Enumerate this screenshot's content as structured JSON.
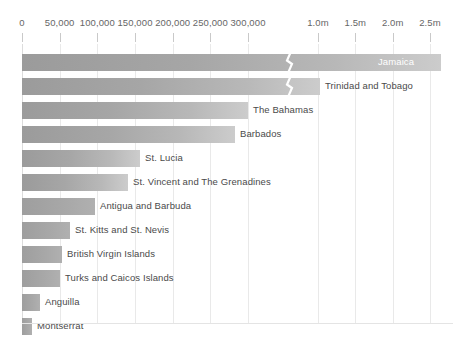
{
  "chart_data": {
    "type": "bar",
    "orientation": "horizontal",
    "title": "",
    "subtitle": "",
    "xlabel": "",
    "ylabel": "",
    "grid": true,
    "legend": "none",
    "broken_axis": true,
    "axis_note": "X axis is broken between 300,000 and 1.0m",
    "axis_segments": [
      {
        "min": 0,
        "max": 300000,
        "ticks": [
          0,
          50000,
          100000,
          150000,
          200000,
          250000,
          300000
        ]
      },
      {
        "min": 1000000,
        "max": 2500000,
        "ticks": [
          1000000,
          1500000,
          2000000,
          2500000
        ]
      }
    ],
    "tick_labels": [
      "0",
      "50,000",
      "100,000",
      "150,000",
      "200,000",
      "250,000",
      "300,000",
      "1.0m",
      "1.5m",
      "2.0m",
      "2.5m"
    ],
    "categories": [
      "Jamaica",
      "Trinidad and Tobago",
      "The Bahamas",
      "Barbados",
      "St. Lucia",
      "St. Vincent and The Grenadines",
      "Antigua and Barbuda",
      "St. Kitts and St. Nevis",
      "British Virgin Islands",
      "Turks and Caicos Islands",
      "Anguilla",
      "Montserrat"
    ],
    "values": [
      2800000,
      1390000,
      298000,
      282000,
      156000,
      140000,
      96000,
      63000,
      53000,
      50000,
      24000,
      13000
    ]
  },
  "axis": {
    "ticks": [
      {
        "label": "0",
        "x": 22,
        "gridline": true
      },
      {
        "label": "50,000",
        "x": 59.7,
        "gridline": true
      },
      {
        "label": "100,000",
        "x": 97.3,
        "gridline": true
      },
      {
        "label": "150,000",
        "x": 135,
        "gridline": true
      },
      {
        "label": "200,000",
        "x": 172.7,
        "gridline": true
      },
      {
        "label": "250,000",
        "x": 210.3,
        "gridline": true
      },
      {
        "label": "300,000",
        "x": 248,
        "gridline": true
      },
      {
        "label": "1.0m",
        "x": 318,
        "gridline": true
      },
      {
        "label": "1.5m",
        "x": 355.3,
        "gridline": true
      },
      {
        "label": "2.0m",
        "x": 392.7,
        "gridline": true
      },
      {
        "label": "2.5m",
        "x": 430,
        "gridline": true
      }
    ]
  },
  "bars": [
    {
      "label": "Jamaica",
      "value": 2800000,
      "end_x": 441,
      "label_inside": true,
      "label_x": 378,
      "break_x": 284,
      "top": 51
    },
    {
      "label": "Trinidad and Tobago",
      "value": 1390000,
      "end_x": 320,
      "label_inside": false,
      "label_x": 325,
      "break_x": 284,
      "top": 75
    },
    {
      "label": "The Bahamas",
      "value": 298000,
      "end_x": 248,
      "label_inside": false,
      "label_x": 253,
      "break_x": null,
      "top": 99
    },
    {
      "label": "Barbados",
      "value": 282000,
      "end_x": 235,
      "label_inside": false,
      "label_x": 240,
      "break_x": null,
      "top": 123
    },
    {
      "label": "St. Lucia",
      "value": 156000,
      "end_x": 140,
      "label_inside": false,
      "label_x": 145,
      "break_x": null,
      "top": 147
    },
    {
      "label": "St. Vincent and The Grenadines",
      "value": 140000,
      "end_x": 128,
      "label_inside": false,
      "label_x": 133,
      "break_x": null,
      "top": 171
    },
    {
      "label": "Antigua and Barbuda",
      "value": 96000,
      "end_x": 95,
      "label_inside": false,
      "label_x": 100,
      "break_x": null,
      "top": 195
    },
    {
      "label": "St. Kitts and St. Nevis",
      "value": 63000,
      "end_x": 70,
      "label_inside": false,
      "label_x": 75,
      "break_x": null,
      "top": 219
    },
    {
      "label": "British Virgin Islands",
      "value": 53000,
      "end_x": 62,
      "label_inside": false,
      "label_x": 67,
      "break_x": null,
      "top": 243
    },
    {
      "label": "Turks and Caicos Islands",
      "value": 50000,
      "end_x": 60,
      "label_inside": false,
      "label_x": 65,
      "break_x": null,
      "top": 267
    },
    {
      "label": "Anguilla",
      "value": 24000,
      "end_x": 40,
      "label_inside": false,
      "label_x": 45,
      "break_x": null,
      "top": 291
    },
    {
      "label": "Montserrat",
      "value": 13000,
      "end_x": 32,
      "label_inside": false,
      "label_x": 37,
      "break_x": null,
      "top": 315
    }
  ],
  "colors": {
    "bar_start": "#9b9b9b",
    "bar_end": "#cccccc",
    "gridline": "#e9e9e9",
    "tick_text": "#666666",
    "label_text": "#4a4a4a",
    "label_text_inside": "#ffffff",
    "background": "#ffffff"
  }
}
